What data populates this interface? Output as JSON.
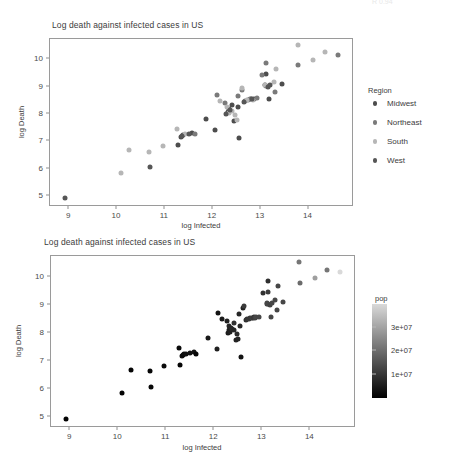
{
  "top_artifact": "R  0.94",
  "charts": [
    {
      "id": "region",
      "title": "Log death against infected cases in US",
      "xlabel": "log Infected",
      "ylabel": "log Death",
      "xticks": [
        "9",
        "10",
        "11",
        "12",
        "13",
        "14"
      ],
      "yticks": [
        "5",
        "6",
        "7",
        "8",
        "9",
        "10"
      ],
      "legend": {
        "type": "discrete",
        "title": "Region",
        "entries": [
          {
            "label": "Midwest",
            "color": "#4d4d4d"
          },
          {
            "label": "Northeast",
            "color": "#7a7a7a"
          },
          {
            "label": "South",
            "color": "#b6b6b6"
          },
          {
            "label": "West",
            "color": "#565656"
          }
        ]
      }
    },
    {
      "id": "pop",
      "title": "Log death against infected cases in US",
      "xlabel": "log Infected",
      "ylabel": "log Death",
      "xticks": [
        "9",
        "10",
        "11",
        "12",
        "13",
        "14"
      ],
      "yticks": [
        "5",
        "6",
        "7",
        "8",
        "9",
        "10"
      ],
      "legend": {
        "type": "colorbar",
        "title": "pop",
        "ticks": [
          "3e+07",
          "2e+07",
          "1e+07"
        ],
        "tick_values": [
          30000000,
          20000000,
          10000000
        ],
        "low_color": "#000000",
        "high_color": "#d9d9d9"
      }
    }
  ],
  "chart_data": [
    {
      "type": "scatter",
      "title": "Log death against infected cases in US",
      "xlabel": "log Infected",
      "ylabel": "log Death",
      "xlim": [
        8.6,
        14.95
      ],
      "ylim": [
        4.6,
        10.75
      ],
      "grid": false,
      "legend_position": "right",
      "legend_title": "Region",
      "series": [
        {
          "name": "Midwest",
          "color": "#4d4d4d",
          "points": [
            [
              11.33,
              7.18
            ],
            [
              11.37,
              7.25
            ],
            [
              11.57,
              7.3
            ],
            [
              11.86,
              7.82
            ],
            [
              12.05,
              7.42
            ],
            [
              12.31,
              8.09
            ],
            [
              12.34,
              8.18
            ],
            [
              12.41,
              8.35
            ],
            [
              12.45,
              7.75
            ],
            [
              12.53,
              8.25
            ],
            [
              12.55,
              7.14
            ],
            [
              12.8,
              8.55
            ],
            [
              12.86,
              8.57
            ],
            [
              13.09,
              9.05
            ],
            [
              13.12,
              9.47
            ],
            [
              13.17,
              8.56
            ],
            [
              13.44,
              9.1
            ],
            [
              11.28,
              6.87
            ]
          ]
        },
        {
          "name": "Northeast",
          "color": "#7a7a7a",
          "points": [
            [
              11.62,
              7.26
            ],
            [
              12.08,
              8.7
            ],
            [
              12.26,
              8.42
            ],
            [
              12.52,
              8.66
            ],
            [
              12.68,
              8.48
            ],
            [
              12.74,
              8.52
            ],
            [
              12.78,
              8.55
            ],
            [
              12.92,
              8.58
            ],
            [
              13.02,
              9.43
            ],
            [
              13.11,
              9.86
            ],
            [
              13.12,
              9.03
            ],
            [
              13.3,
              8.82
            ],
            [
              13.78,
              9.8
            ],
            [
              14.62,
              10.17
            ],
            [
              12.6,
              8.9
            ]
          ]
        },
        {
          "name": "South",
          "color": "#b6b6b6",
          "points": [
            [
              10.08,
              5.86
            ],
            [
              10.26,
              6.68
            ],
            [
              10.67,
              6.63
            ],
            [
              10.95,
              6.83
            ],
            [
              11.26,
              7.45
            ],
            [
              11.41,
              7.26
            ],
            [
              12.16,
              8.48
            ],
            [
              12.3,
              8.26
            ],
            [
              12.33,
              8.04
            ],
            [
              12.4,
              8.12
            ],
            [
              12.47,
              7.96
            ],
            [
              12.5,
              7.79
            ],
            [
              12.62,
              8.95
            ],
            [
              12.72,
              8.5
            ],
            [
              12.84,
              8.53
            ],
            [
              13.1,
              9.08
            ],
            [
              13.27,
              9.19
            ],
            [
              13.32,
              9.67
            ],
            [
              13.77,
              10.52
            ],
            [
              14.09,
              9.98
            ],
            [
              14.35,
              10.26
            ]
          ]
        },
        {
          "name": "West",
          "color": "#565656",
          "points": [
            [
              8.92,
              4.93
            ],
            [
              10.69,
              6.08
            ],
            [
              11.35,
              7.21
            ],
            [
              11.5,
              7.27
            ],
            [
              12.28,
              8.01
            ],
            [
              12.37,
              8.14
            ],
            [
              12.66,
              8.46
            ],
            [
              12.82,
              8.56
            ],
            [
              13.15,
              9.0
            ],
            [
              13.2,
              9.06
            ]
          ]
        }
      ]
    },
    {
      "type": "scatter",
      "title": "Log death against infected cases in US",
      "xlabel": "log Infected",
      "ylabel": "log Death",
      "xlim": [
        8.6,
        14.95
      ],
      "ylim": [
        4.6,
        10.75
      ],
      "grid": false,
      "legend_position": "right",
      "legend_title": "pop",
      "colorbar": {
        "min": 0,
        "max": 39500000,
        "ticks": [
          10000000,
          20000000,
          30000000
        ]
      },
      "points": [
        [
          8.92,
          4.93,
          580000
        ],
        [
          10.08,
          5.86,
          760000
        ],
        [
          10.26,
          6.68,
          890000
        ],
        [
          10.67,
          6.63,
          1060000
        ],
        [
          10.69,
          6.08,
          1360000
        ],
        [
          10.95,
          6.83,
          1790000
        ],
        [
          11.26,
          7.45,
          1800000
        ],
        [
          11.28,
          6.87,
          1070000
        ],
        [
          11.33,
          7.18,
          3000000
        ],
        [
          11.35,
          7.21,
          1680000
        ],
        [
          11.37,
          7.25,
          2100000
        ],
        [
          11.41,
          7.26,
          2900000
        ],
        [
          11.5,
          7.27,
          3200000
        ],
        [
          11.57,
          7.3,
          3500000
        ],
        [
          11.62,
          7.26,
          1360000
        ],
        [
          11.86,
          7.82,
          4470000
        ],
        [
          12.05,
          7.42,
          5760000
        ],
        [
          12.08,
          8.7,
          3570000
        ],
        [
          12.16,
          8.48,
          4650000
        ],
        [
          12.26,
          8.42,
          6050000
        ],
        [
          12.28,
          8.01,
          5030000
        ],
        [
          12.3,
          8.26,
          6920000
        ],
        [
          12.31,
          8.09,
          5640000
        ],
        [
          12.33,
          8.04,
          5820000
        ],
        [
          12.34,
          8.18,
          6830000
        ],
        [
          12.37,
          8.14,
          7280000
        ],
        [
          12.4,
          8.12,
          6730000
        ],
        [
          12.41,
          8.35,
          8880000
        ],
        [
          12.45,
          7.75,
          6130000
        ],
        [
          12.47,
          7.96,
          7610000
        ],
        [
          12.5,
          7.79,
          6540000
        ],
        [
          12.52,
          8.66,
          6890000
        ],
        [
          12.53,
          8.25,
          7010000
        ],
        [
          12.55,
          7.14,
          3280000
        ],
        [
          12.6,
          8.9,
          5880000
        ],
        [
          12.62,
          8.95,
          10710000
        ],
        [
          12.66,
          8.46,
          8530000
        ],
        [
          12.68,
          8.48,
          9990000
        ],
        [
          12.72,
          8.5,
          10480000
        ],
        [
          12.74,
          8.52,
          9990000
        ],
        [
          12.78,
          8.55,
          11690000
        ],
        [
          12.8,
          8.55,
          10610000
        ],
        [
          12.82,
          8.56,
          9830000
        ],
        [
          12.84,
          8.53,
          11800000
        ],
        [
          12.86,
          8.57,
          12810000
        ],
        [
          12.92,
          8.58,
          12670000
        ],
        [
          13.02,
          9.43,
          8880000
        ],
        [
          13.09,
          9.05,
          11690000
        ],
        [
          13.1,
          9.08,
          12800000
        ],
        [
          13.11,
          9.86,
          8530000
        ],
        [
          13.12,
          9.03,
          12810000
        ],
        [
          13.12,
          9.47,
          10610000
        ],
        [
          13.15,
          9.0,
          11800000
        ],
        [
          13.17,
          8.56,
          12670000
        ],
        [
          13.2,
          9.06,
          12800000
        ],
        [
          13.27,
          9.19,
          13000000
        ],
        [
          13.3,
          8.82,
          12810000
        ],
        [
          13.32,
          9.67,
          12800000
        ],
        [
          13.44,
          9.1,
          12670000
        ],
        [
          13.77,
          10.52,
          21480000
        ],
        [
          13.78,
          9.8,
          19450000
        ],
        [
          14.09,
          9.98,
          29000000
        ],
        [
          14.35,
          10.26,
          21480000
        ],
        [
          14.62,
          10.17,
          39510000
        ]
      ]
    }
  ]
}
